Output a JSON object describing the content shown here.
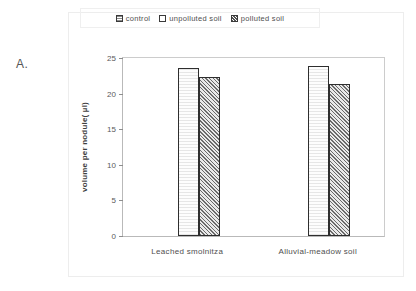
{
  "panel": {
    "label": "A."
  },
  "legend": {
    "position": "top-center",
    "entries": [
      {
        "label": "control",
        "swatch": "dotted-square-icon",
        "pattern": "fill-control"
      },
      {
        "label": "unpolluted soil",
        "swatch": "open-square-icon",
        "pattern": "fill-unpolluted"
      },
      {
        "label": "polluted soil",
        "swatch": "crosshatch-square-icon",
        "pattern": "fill-polluted"
      }
    ]
  },
  "axes": {
    "ylabel": "volume per nodule( µl)",
    "yticks": [
      0,
      5,
      10,
      15,
      20,
      25
    ],
    "ytick_labels": [
      "0",
      "5",
      "10",
      "15",
      "20",
      "25"
    ],
    "ylim": [
      0,
      25
    ],
    "xlabel": ""
  },
  "chart_data": {
    "type": "bar",
    "title": "",
    "subtitle": "",
    "xlabel": "",
    "ylabel": "volume per nodule( µl)",
    "ylim": [
      0,
      25
    ],
    "yticks": [
      0,
      5,
      10,
      15,
      20,
      25
    ],
    "grid": false,
    "legend_position": "top-center",
    "categories": [
      "Leached smolnitza",
      "Alluvial-meadow soil"
    ],
    "series": [
      {
        "name": "control",
        "values": [
          0,
          0
        ]
      },
      {
        "name": "unpolluted soil",
        "values": [
          23.6,
          23.9
        ]
      },
      {
        "name": "polluted soil",
        "values": [
          22.3,
          21.3
        ]
      }
    ]
  }
}
